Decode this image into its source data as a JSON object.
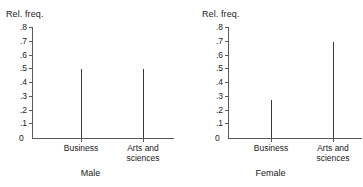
{
  "figure": {
    "axis_title": "Rel. freq.",
    "y_ticks": [
      ".8",
      ".7",
      ".6",
      ".5",
      ".4",
      ".3",
      ".2",
      ".1"
    ],
    "y_zero": "0",
    "categories": [
      "Business",
      "Arts and\nsciences"
    ]
  },
  "panels": [
    {
      "caption": "Male",
      "axis_title": "Rel. freq.",
      "y_zero": "0",
      "cat0": "Business",
      "cat1": "Arts and\nsciences",
      "v0": "0.50",
      "v1": "0.50"
    },
    {
      "caption": "Female",
      "axis_title": "Rel. freq.",
      "y_zero": "0",
      "cat0": "Business",
      "cat1": "Arts and\nsciences",
      "v0": "0.28",
      "v1": "0.70"
    }
  ],
  "chart_data": [
    {
      "type": "bar",
      "title": "Male",
      "categories": [
        "Business",
        "Arts and sciences"
      ],
      "values": [
        0.5,
        0.5
      ],
      "xlabel": "Male",
      "ylabel": "Rel. freq.",
      "ylim": [
        0,
        0.8
      ],
      "ytick_values": [
        0,
        0.1,
        0.2,
        0.3,
        0.4,
        0.5,
        0.6,
        0.7,
        0.8
      ],
      "ytick_labels": [
        "0",
        ".1",
        ".2",
        ".3",
        ".4",
        ".5",
        ".6",
        ".7",
        ".8"
      ],
      "grid": false,
      "legend": "none",
      "style": "spike"
    },
    {
      "type": "bar",
      "title": "Female",
      "categories": [
        "Business",
        "Arts and sciences"
      ],
      "values": [
        0.28,
        0.7
      ],
      "xlabel": "Female",
      "ylabel": "Rel. freq.",
      "ylim": [
        0,
        0.8
      ],
      "ytick_values": [
        0,
        0.1,
        0.2,
        0.3,
        0.4,
        0.5,
        0.6,
        0.7,
        0.8
      ],
      "ytick_labels": [
        "0",
        ".1",
        ".2",
        ".3",
        ".4",
        ".5",
        ".6",
        ".7",
        ".8"
      ],
      "grid": false,
      "legend": "none",
      "style": "spike"
    }
  ]
}
